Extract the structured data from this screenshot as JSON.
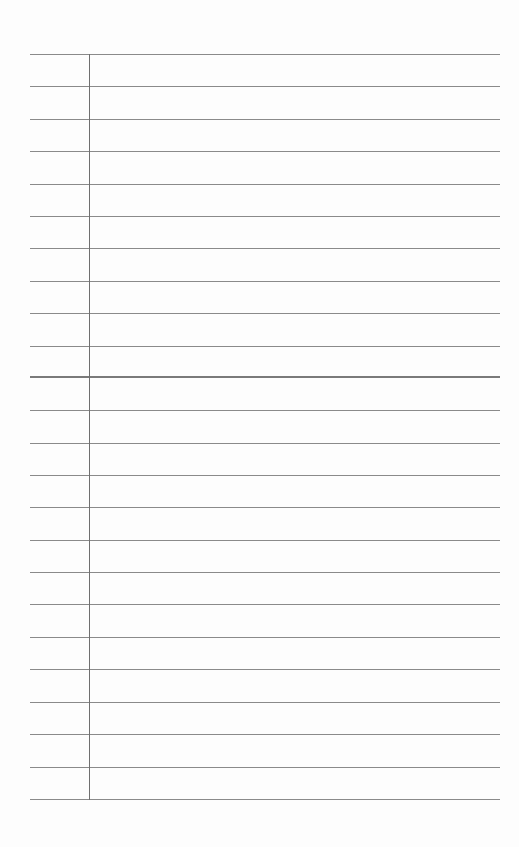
{
  "page": {
    "type": "lined-paper",
    "rule_color": "#8a8a8a",
    "margin_color": "#6f6f6f",
    "rules": [
      {
        "y": 54,
        "bold": false
      },
      {
        "y": 86,
        "bold": false
      },
      {
        "y": 119,
        "bold": false
      },
      {
        "y": 151,
        "bold": false
      },
      {
        "y": 184,
        "bold": false
      },
      {
        "y": 216,
        "bold": false
      },
      {
        "y": 248,
        "bold": false
      },
      {
        "y": 281,
        "bold": false
      },
      {
        "y": 313,
        "bold": false
      },
      {
        "y": 346,
        "bold": false
      },
      {
        "y": 376,
        "bold": true
      },
      {
        "y": 410,
        "bold": false
      },
      {
        "y": 443,
        "bold": false
      },
      {
        "y": 475,
        "bold": false
      },
      {
        "y": 507,
        "bold": false
      },
      {
        "y": 540,
        "bold": false
      },
      {
        "y": 572,
        "bold": false
      },
      {
        "y": 604,
        "bold": false
      },
      {
        "y": 637,
        "bold": false
      },
      {
        "y": 669,
        "bold": false
      },
      {
        "y": 702,
        "bold": false
      },
      {
        "y": 734,
        "bold": false
      },
      {
        "y": 767,
        "bold": false
      },
      {
        "y": 799,
        "bold": false
      }
    ],
    "margin_line": {
      "x": 89,
      "top": 54,
      "bottom": 799
    }
  }
}
